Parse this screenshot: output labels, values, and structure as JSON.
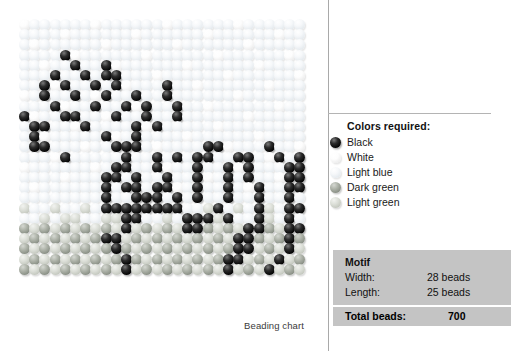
{
  "chart": {
    "caption": "Beading chart",
    "grid": {
      "columns": 28,
      "rows": 25,
      "bead_px": 11,
      "pitch_px": 10.2
    }
  },
  "legend": {
    "title": "Colors required:",
    "items": [
      {
        "label": "Black",
        "key": "black",
        "color": "#050505",
        "icon": "bead-icon"
      },
      {
        "label": "White",
        "key": "white",
        "color": "#f4f4f4",
        "icon": "bead-icon"
      },
      {
        "label": "Light blue",
        "key": "lightblue",
        "color": "#e6ebef",
        "icon": "bead-icon"
      },
      {
        "label": "Dark green",
        "key": "darkgreen",
        "color": "#8b9187",
        "icon": "bead-icon"
      },
      {
        "label": "Light green",
        "key": "lightgreen",
        "color": "#c4c8bf",
        "icon": "bead-icon"
      }
    ]
  },
  "motif": {
    "heading": "Motif",
    "rows": [
      {
        "label": "Width:",
        "value": "28 beads"
      },
      {
        "label": "Length:",
        "value": "25 beads"
      }
    ],
    "total_label": "Total beads:",
    "total_value": "700"
  },
  "chart_data": {
    "type": "heatmap",
    "title": "Beading chart",
    "xlabel": "",
    "ylabel": "",
    "columns": 28,
    "rows": 25,
    "palette": {
      "0": "lightblue",
      "1": "black",
      "2": "white",
      "3": "darkgreen",
      "4": "lightgreen"
    },
    "legend_position": "right",
    "grid": false,
    "cells": [
      "0000000000000000000000000000",
      "0000000000000000000000000000",
      "0000000000000000000000000000",
      "0000100000000000000000000000",
      "0000010010000000000000000000",
      "0001001011000000000000000000",
      "0010100101000010000000000000",
      "0010010010010010000000000000",
      "0001000100101001000000000000",
      "1000110001001001000000000000",
      "0110001000010100000000000000",
      "0100000010010000000000000000",
      "0110000001110000001100001000",
      "0000100000100101011001100101",
      "0000000001100100010010100011",
      "0000000011010010010010100011",
      "0000000010110110010010010011",
      "0000000010011101010010010010",
      "0000000011111111000100010011",
      "0000000000110000111010010010",
      "0000000000100000110000110011",
      "0000000011000000000001100010",
      "0000000001000000000001100010",
      "0000000000100000000011000100",
      "0000000000100000000010001000"
    ],
    "ground_rows_start": 17,
    "ground_description": "Lower portion of the chart uses alternating dark green and light green beads for the ground; upper portion uses light blue and white beads for the sky."
  }
}
